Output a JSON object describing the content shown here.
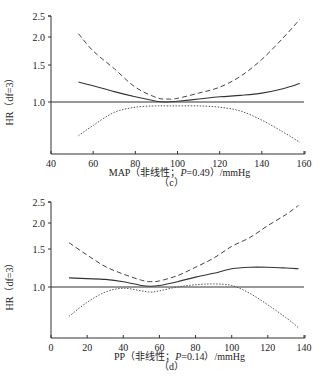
{
  "chart_data": [
    {
      "type": "line",
      "panel": "(c)",
      "xlabel": "MAP（非线性；P=0.49）/mmHg",
      "xlabel_parts": {
        "prefix": "MAP（非线性；",
        "p_symbol": "P",
        "p_value": "=0.49）/mmHg"
      },
      "ylabel": "HR（df=3）",
      "xlim": [
        40,
        160
      ],
      "xticks": [
        40,
        60,
        80,
        100,
        120,
        140,
        160
      ],
      "ylim": [
        0.7,
        2.5
      ],
      "yticks": [
        1.0,
        1.5,
        2.0,
        2.5
      ],
      "reference_line": 1.0,
      "grid": false,
      "x": [
        53,
        60,
        70,
        80,
        90,
        95,
        100,
        110,
        120,
        130,
        140,
        150,
        158
      ],
      "series": [
        {
          "name": "HR estimate",
          "style": "solid",
          "values": [
            1.27,
            1.22,
            1.14,
            1.07,
            1.01,
            1.0,
            1.01,
            1.04,
            1.07,
            1.09,
            1.12,
            1.18,
            1.25
          ]
        },
        {
          "name": "Upper 95% CI",
          "style": "dashed",
          "values": [
            2.08,
            1.75,
            1.45,
            1.2,
            1.06,
            1.04,
            1.05,
            1.12,
            1.2,
            1.35,
            1.6,
            1.98,
            2.42
          ]
        },
        {
          "name": "Lower 95% CI",
          "style": "dotted",
          "values": [
            0.74,
            0.82,
            0.92,
            0.96,
            0.97,
            0.97,
            0.97,
            0.97,
            0.96,
            0.93,
            0.86,
            0.77,
            0.69
          ]
        }
      ]
    },
    {
      "type": "line",
      "panel": "(d)",
      "xlabel": "PP（非线性；P=0.14）/mmHg",
      "xlabel_parts": {
        "prefix": "PP（非线性；",
        "p_symbol": "P",
        "p_value": "=0.14）/mmHg"
      },
      "ylabel": "HR（df=3）",
      "xlim": [
        0,
        140
      ],
      "xticks": [
        0,
        20,
        40,
        60,
        80,
        100,
        120,
        140
      ],
      "ylim": [
        0.7,
        2.5
      ],
      "yticks": [
        1.0,
        1.5,
        2.0,
        2.5
      ],
      "reference_line": 1.0,
      "grid": false,
      "x": [
        10,
        20,
        30,
        40,
        50,
        55,
        60,
        70,
        80,
        90,
        100,
        110,
        120,
        130,
        137
      ],
      "series": [
        {
          "name": "HR estimate",
          "style": "solid",
          "values": [
            1.12,
            1.11,
            1.1,
            1.07,
            1.02,
            1.01,
            1.02,
            1.07,
            1.13,
            1.18,
            1.24,
            1.26,
            1.26,
            1.25,
            1.24
          ]
        },
        {
          "name": "Upper 95% CI",
          "style": "dashed",
          "values": [
            1.62,
            1.42,
            1.27,
            1.17,
            1.09,
            1.07,
            1.08,
            1.15,
            1.26,
            1.38,
            1.55,
            1.72,
            1.95,
            2.2,
            2.42
          ]
        },
        {
          "name": "Lower 95% CI",
          "style": "dotted",
          "values": [
            0.77,
            0.88,
            0.96,
            0.99,
            0.97,
            0.96,
            0.97,
            1.0,
            1.03,
            1.04,
            1.02,
            0.95,
            0.86,
            0.76,
            0.68
          ]
        }
      ]
    }
  ],
  "panels": [
    {
      "id": "c",
      "caption": "（c）"
    },
    {
      "id": "d",
      "caption": "（d）"
    }
  ]
}
